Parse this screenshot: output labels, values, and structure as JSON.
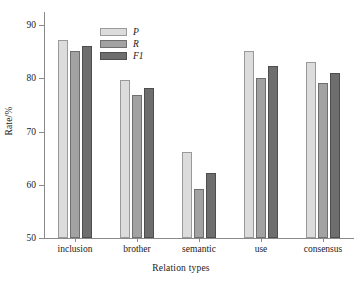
{
  "chart_data": {
    "type": "bar",
    "title": "",
    "xlabel": "Relation types",
    "ylabel": "Rate/%",
    "categories": [
      "inclusion",
      "brother",
      "semantic",
      "use",
      "consensus"
    ],
    "series": [
      {
        "name": "P",
        "values": [
          87.3,
          79.8,
          66.1,
          85.2,
          83.1
        ],
        "color": "#dcdcdc"
      },
      {
        "name": "R",
        "values": [
          85.2,
          76.8,
          59.2,
          80.0,
          79.1
        ],
        "color": "#a2a2a2"
      },
      {
        "name": "F1",
        "values": [
          86.2,
          78.2,
          62.3,
          82.4,
          81.1
        ],
        "color": "#6e6e6e"
      }
    ],
    "ylim": [
      50,
      92.5
    ],
    "yticks": [
      50,
      60,
      70,
      80,
      90
    ],
    "ytick_labels": [
      "50",
      "60",
      "70",
      "80",
      "90"
    ],
    "grid": false,
    "legend_position": "top-left"
  }
}
